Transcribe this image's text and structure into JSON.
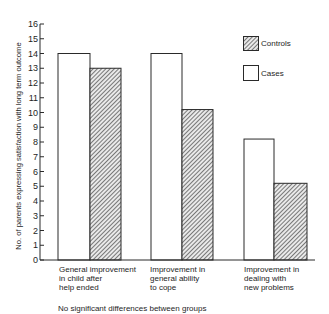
{
  "chart_data": {
    "type": "bar",
    "title": "",
    "xlabel": "",
    "ylabel": "No. of parents expressing satisfaction with long term outcome",
    "ylim": [
      0,
      16
    ],
    "yticks": [
      0,
      1,
      2,
      3,
      4,
      5,
      6,
      7,
      8,
      9,
      10,
      11,
      12,
      13,
      14,
      15,
      16
    ],
    "grid": false,
    "legend_position": "upper right",
    "categories": [
      "General improvement in child after help ended",
      "Improvement in general ability to cope",
      "Improvement in dealing with new problems"
    ],
    "category_lines": [
      [
        "General improvement",
        "in child after",
        "help ended"
      ],
      [
        "Improvement in",
        "general ability",
        "to cope"
      ],
      [
        "Improvement in",
        "dealing with",
        "new problems"
      ]
    ],
    "series": [
      {
        "name": "Cases",
        "values": [
          14,
          14,
          8.2
        ],
        "fill": "#ffffff"
      },
      {
        "name": "Controls",
        "values": [
          13,
          10.2,
          5.2
        ],
        "fill": "hatched"
      }
    ],
    "legend": [
      {
        "label": "Controls",
        "style": "hatched"
      },
      {
        "label": "Cases",
        "style": "open"
      }
    ],
    "annotation": "No significant differences between groups"
  }
}
